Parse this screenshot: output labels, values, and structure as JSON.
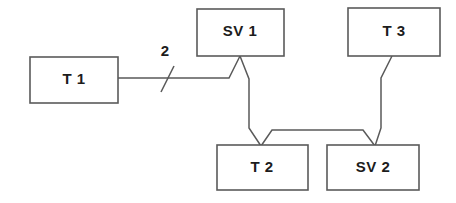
{
  "diagram": {
    "type": "block-diagram",
    "background_color": "#ffffff",
    "line_color": "#5a5a5a",
    "text_color": "#1c1c1c",
    "nodes": [
      {
        "id": "t1",
        "label": "T 1",
        "x": 30,
        "y": 57,
        "width": 88,
        "height": 46,
        "center_x": 74,
        "center_y": 80
      },
      {
        "id": "sv1",
        "label": "SV 1",
        "x": 197,
        "y": 9,
        "width": 87,
        "height": 47,
        "center_x": 240,
        "center_y": 32
      },
      {
        "id": "t3",
        "label": "T 3",
        "x": 348,
        "y": 8,
        "width": 92,
        "height": 48,
        "center_x": 394,
        "center_y": 32
      },
      {
        "id": "t2",
        "label": "T 2",
        "x": 217,
        "y": 145,
        "width": 91,
        "height": 45,
        "center_x": 262,
        "center_y": 168
      },
      {
        "id": "sv2",
        "label": "SV 2",
        "x": 327,
        "y": 145,
        "width": 92,
        "height": 45,
        "center_x": 373,
        "center_y": 168
      }
    ],
    "edges": [
      {
        "id": "edge-t1-sv1",
        "from": "t1",
        "to": "sv1",
        "points": "118,78 229,78 240,56"
      },
      {
        "id": "edge-sv1-t2",
        "from": "sv1",
        "to": "t2",
        "points": "240,56 249,79 249,128 261,146"
      },
      {
        "id": "edge-t2-sv2",
        "from": "t2",
        "to": "sv2",
        "points": "261,146 272,130 363,130 375,146"
      },
      {
        "id": "edge-t3-sv2",
        "from": "t3",
        "to": "sv2",
        "points": "392,56 381,78 381,128 375,146"
      }
    ],
    "edge_labels": [
      {
        "id": "label-2",
        "text": "2",
        "x": 165,
        "y": 52
      }
    ],
    "tick_marks": [
      {
        "id": "tick-on-t1-sv1",
        "points": "161,92 174,66"
      }
    ]
  }
}
